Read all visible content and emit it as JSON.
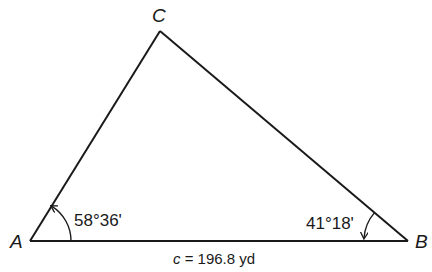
{
  "diagram": {
    "type": "triangle",
    "vertices": {
      "A": {
        "label": "A",
        "x": 30,
        "y": 241
      },
      "B": {
        "label": "B",
        "x": 408,
        "y": 241
      },
      "C": {
        "label": "C",
        "x": 160,
        "y": 31
      }
    },
    "angles": {
      "A": {
        "label": "58°36'"
      },
      "B": {
        "label": "41°18'"
      }
    },
    "sides": {
      "c": {
        "label_var": "c",
        "label_rest": " = 196.8 yd"
      }
    },
    "colors": {
      "stroke": "#1a1a1a",
      "background": "#ffffff"
    }
  }
}
